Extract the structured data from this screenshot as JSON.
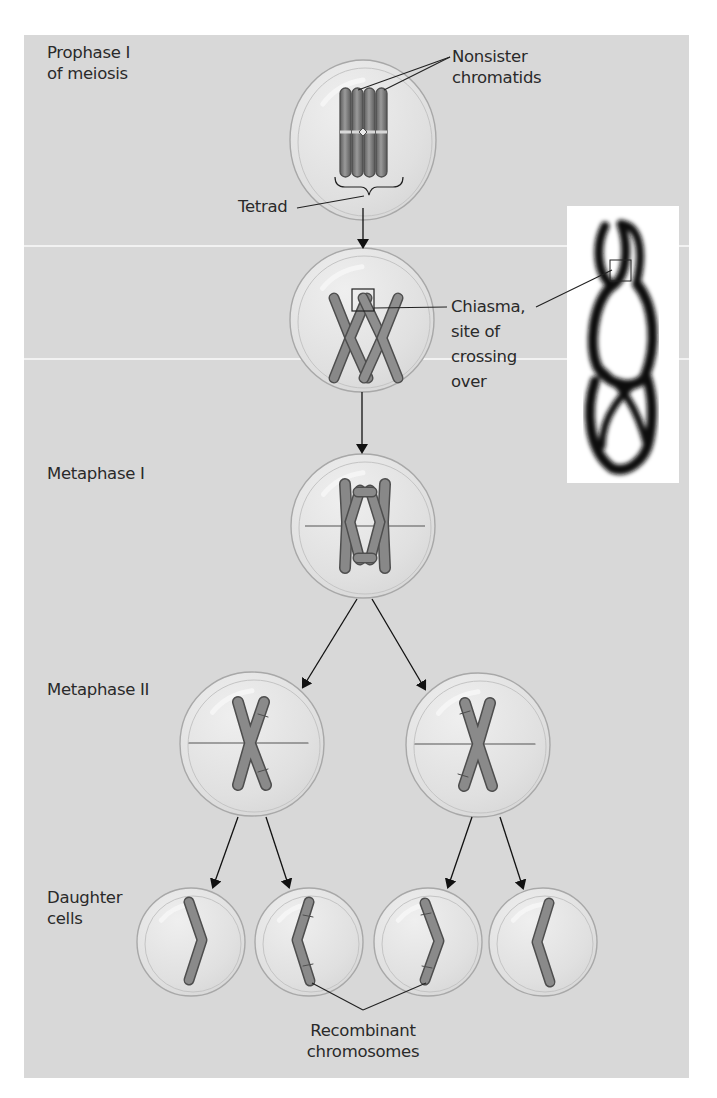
{
  "figure": {
    "colors": {
      "panel": "#d8d8d8",
      "cell_fill": "#e4e4e4",
      "cell_stroke": "#a8a8a8",
      "chromosome": "#7c7c7c",
      "chromosome_outline": "#4e4e4e",
      "line": "#222222"
    }
  },
  "labels": {
    "prophase": "Prophase I\nof meiosis",
    "nonsister": "Nonsister\nchromatids",
    "tetrad": "Tetrad",
    "chiasma": "Chiasma,\nsite of\ncrossing\nover",
    "metaphase1": "Metaphase I",
    "metaphase2": "Metaphase II",
    "daughter": "Daughter\ncells",
    "recombinant": "Recombinant\nchromosomes"
  },
  "stages": [
    {
      "id": "prophase-cell",
      "cx": 363,
      "cy": 140,
      "rx": 73,
      "ry": 80
    },
    {
      "id": "chiasma-cell",
      "cx": 362,
      "cy": 320,
      "rx": 72,
      "ry": 72
    },
    {
      "id": "metaphase1-cell",
      "cx": 363,
      "cy": 526,
      "rx": 72,
      "ry": 72
    },
    {
      "id": "metaphase2-left-cell",
      "cx": 252,
      "cy": 744,
      "rx": 72,
      "ry": 72
    },
    {
      "id": "metaphase2-right-cell",
      "cx": 478,
      "cy": 745,
      "rx": 72,
      "ry": 72
    },
    {
      "id": "daughter-cell-1",
      "cx": 191,
      "cy": 942,
      "rx": 54,
      "ry": 54
    },
    {
      "id": "daughter-cell-2",
      "cx": 309,
      "cy": 942,
      "rx": 54,
      "ry": 54
    },
    {
      "id": "daughter-cell-3",
      "cx": 428,
      "cy": 942,
      "rx": 54,
      "ry": 54
    },
    {
      "id": "daughter-cell-4",
      "cx": 543,
      "cy": 942,
      "rx": 54,
      "ry": 54
    }
  ],
  "micrograph": {
    "label": "Electron micrograph of tetrad showing chiasma"
  }
}
